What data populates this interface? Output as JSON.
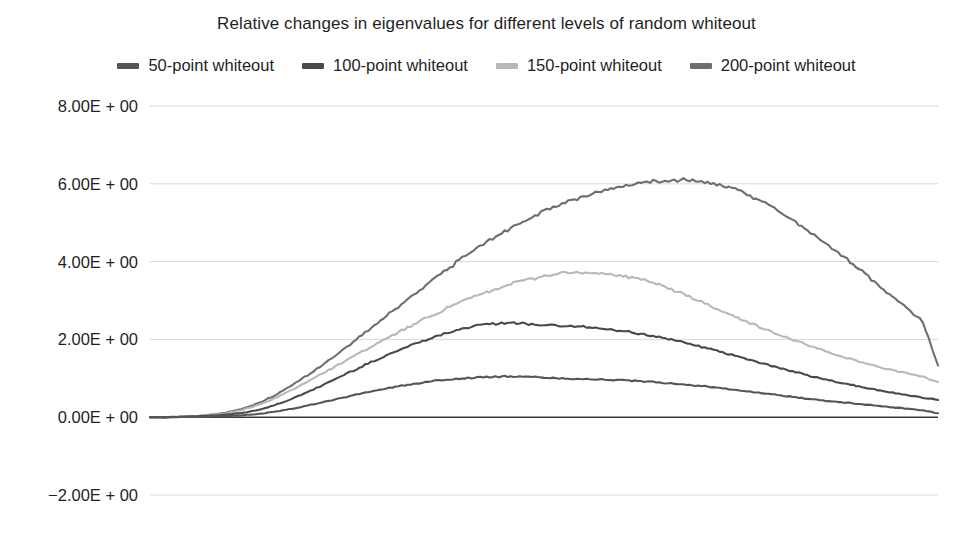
{
  "chart_data": {
    "type": "line",
    "title": "Relative changes in eigenvalues for different levels of random whiteout",
    "xlabel": "",
    "ylabel": "",
    "ylim": [
      -2.0,
      8.0
    ],
    "yticks": [
      "-2.00E + 00",
      "0.00E + 00",
      "2.00E + 00",
      "4.00E + 00",
      "6.00E + 00",
      "8.00E + 00"
    ],
    "ytick_values": [
      -2.0,
      0.0,
      2.0,
      4.0,
      6.0,
      8.0
    ],
    "ytick_labels_display": [
      "8.00E + 00",
      "6.00E + 00",
      "4.00E + 00",
      "2.00E + 00",
      "0.00E + 00",
      "−2.00E + 00"
    ],
    "grid": true,
    "grid_axis": "y",
    "legend_position": "top",
    "x_axis_visible_ticks": false,
    "zero_line": true,
    "x": [
      0,
      0.02,
      0.04,
      0.06,
      0.08,
      0.1,
      0.12,
      0.14,
      0.16,
      0.18,
      0.2,
      0.22,
      0.24,
      0.26,
      0.28,
      0.3,
      0.32,
      0.34,
      0.36,
      0.38,
      0.4,
      0.42,
      0.44,
      0.46,
      0.48,
      0.5,
      0.52,
      0.54,
      0.56,
      0.58,
      0.6,
      0.62,
      0.64,
      0.66,
      0.68,
      0.7,
      0.72,
      0.74,
      0.76,
      0.78,
      0.8,
      0.82,
      0.84,
      0.86,
      0.88,
      0.9,
      0.92,
      0.94,
      0.96,
      0.98,
      1.0
    ],
    "series": [
      {
        "name": "50-point whiteout",
        "color": "#555555",
        "peak_value": 1.05,
        "peak_x": 0.38,
        "end_value": 0.1,
        "values": [
          0.0,
          0.0,
          0.01,
          0.01,
          0.02,
          0.03,
          0.05,
          0.09,
          0.15,
          0.22,
          0.3,
          0.39,
          0.48,
          0.57,
          0.66,
          0.74,
          0.81,
          0.87,
          0.93,
          0.97,
          1.0,
          1.03,
          1.04,
          1.05,
          1.04,
          1.02,
          1.0,
          0.99,
          0.98,
          0.96,
          0.95,
          0.93,
          0.9,
          0.87,
          0.84,
          0.8,
          0.76,
          0.71,
          0.66,
          0.61,
          0.56,
          0.51,
          0.46,
          0.42,
          0.38,
          0.34,
          0.3,
          0.26,
          0.22,
          0.18,
          0.1
        ]
      },
      {
        "name": "100-point whiteout",
        "color": "#4a4a4a",
        "peak_value": 2.42,
        "peak_x": 0.4,
        "end_value": 0.45,
        "values": [
          0.0,
          0.0,
          0.01,
          0.02,
          0.04,
          0.07,
          0.12,
          0.2,
          0.32,
          0.47,
          0.64,
          0.83,
          1.03,
          1.22,
          1.41,
          1.59,
          1.76,
          1.92,
          2.06,
          2.19,
          2.3,
          2.37,
          2.41,
          2.42,
          2.4,
          2.37,
          2.35,
          2.33,
          2.3,
          2.26,
          2.21,
          2.15,
          2.08,
          2.0,
          1.91,
          1.81,
          1.7,
          1.59,
          1.48,
          1.37,
          1.26,
          1.15,
          1.05,
          0.96,
          0.87,
          0.79,
          0.71,
          0.64,
          0.57,
          0.5,
          0.45
        ]
      },
      {
        "name": "150-point whiteout",
        "color": "#b8b8b8",
        "peak_value": 3.72,
        "peak_x": 0.5,
        "end_value": 0.9,
        "values": [
          0.0,
          0.0,
          0.01,
          0.03,
          0.06,
          0.11,
          0.2,
          0.33,
          0.5,
          0.7,
          0.92,
          1.14,
          1.36,
          1.58,
          1.8,
          2.02,
          2.23,
          2.44,
          2.64,
          2.83,
          3.0,
          3.16,
          3.3,
          3.43,
          3.54,
          3.63,
          3.69,
          3.72,
          3.71,
          3.68,
          3.63,
          3.55,
          3.44,
          3.3,
          3.14,
          2.96,
          2.78,
          2.6,
          2.43,
          2.27,
          2.11,
          1.96,
          1.82,
          1.68,
          1.55,
          1.43,
          1.32,
          1.22,
          1.13,
          1.05,
          0.9
        ]
      },
      {
        "name": "200-point whiteout",
        "color": "#6e6e6e",
        "peak_value": 6.1,
        "peak_x": 0.62,
        "end_value": 1.35,
        "values": [
          0.0,
          0.0,
          0.01,
          0.03,
          0.07,
          0.13,
          0.23,
          0.38,
          0.58,
          0.82,
          1.08,
          1.36,
          1.66,
          1.97,
          2.28,
          2.6,
          2.92,
          3.24,
          3.55,
          3.85,
          4.14,
          4.41,
          4.66,
          4.89,
          5.1,
          5.29,
          5.46,
          5.61,
          5.74,
          5.85,
          5.94,
          6.01,
          6.06,
          6.09,
          6.1,
          6.06,
          5.98,
          5.86,
          5.7,
          5.5,
          5.27,
          5.01,
          4.73,
          4.43,
          4.12,
          3.8,
          3.47,
          3.14,
          2.81,
          2.48,
          1.35
        ]
      }
    ]
  },
  "colors": {
    "grid": "#d9d9d9",
    "axis_zero": "#3a3a3a",
    "text": "#1f1f1f",
    "background": "#ffffff"
  },
  "legend": {
    "items": [
      {
        "label": "50-point whiteout",
        "color": "#555555",
        "swatch": "legend-swatch-50"
      },
      {
        "label": "100-point whiteout",
        "color": "#4a4a4a",
        "swatch": "legend-swatch-100"
      },
      {
        "label": "150-point whiteout",
        "color": "#b8b8b8",
        "swatch": "legend-swatch-150"
      },
      {
        "label": "200-point whiteout",
        "color": "#6e6e6e",
        "swatch": "legend-swatch-200"
      }
    ]
  },
  "yaxis": {
    "labels": [
      {
        "text": "8.00E + 00",
        "value": 8.0
      },
      {
        "text": "6.00E + 00",
        "value": 6.0
      },
      {
        "text": "4.00E + 00",
        "value": 4.0
      },
      {
        "text": "2.00E + 00",
        "value": 2.0
      },
      {
        "text": "0.00E + 00",
        "value": 0.0
      },
      {
        "text": "−2.00E + 00",
        "value": -2.0
      }
    ]
  }
}
